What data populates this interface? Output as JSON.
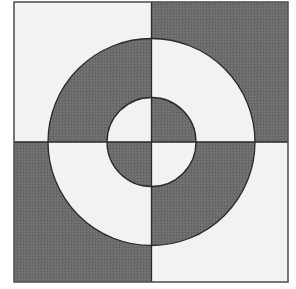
{
  "figure": {
    "outer_square": {
      "x": 14,
      "y": 2,
      "width": 274,
      "height": 280
    },
    "center": {
      "x": 151.5,
      "y": 142
    },
    "outer_radius": 103.5,
    "inner_radius": 44.5,
    "colors": {
      "light": "#f2f2f2",
      "dark": "#6b6b6b",
      "stroke": "#2a2a2a",
      "background": "#ffffff"
    },
    "quadrants": {
      "top_left": {
        "outer_region": "light",
        "ring": "dark",
        "inner_disc": "light"
      },
      "top_right": {
        "outer_region": "dark",
        "ring": "light",
        "inner_disc": "dark"
      },
      "bottom_left": {
        "outer_region": "dark",
        "ring": "light",
        "inner_disc": "dark"
      },
      "bottom_right": {
        "outer_region": "light",
        "ring": "dark",
        "inner_disc": "light"
      }
    }
  }
}
